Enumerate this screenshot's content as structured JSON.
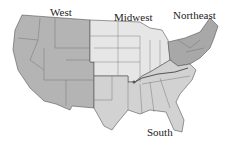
{
  "map": {
    "title": "United States census regions",
    "regions": [
      {
        "name": "West",
        "color": "#b4b4b4"
      },
      {
        "name": "Midwest",
        "color": "#e6e6e6"
      },
      {
        "name": "Northeast",
        "color": "#a8a8a8"
      },
      {
        "name": "South",
        "color": "#d2d2d2"
      }
    ],
    "labels": {
      "west": "West",
      "midwest": "Midwest",
      "northeast": "Northeast",
      "south": "South"
    },
    "border_color": "#555555"
  }
}
